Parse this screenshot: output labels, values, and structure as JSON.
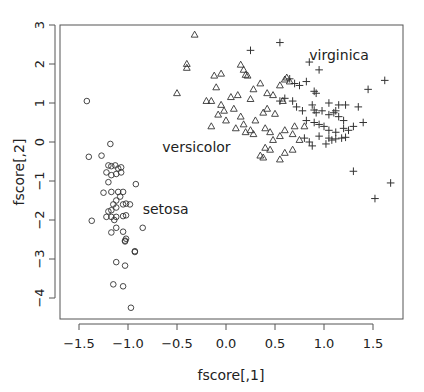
{
  "chart_data": {
    "type": "scatter",
    "title": "",
    "xlabel": "fscore[,1]",
    "ylabel": "fscore[,2]",
    "xlim": [
      -1.5,
      1.8
    ],
    "ylim": [
      -4.4,
      3.0
    ],
    "x_ticks": [
      -1.5,
      -1.0,
      -0.5,
      0.0,
      0.5,
      1.0,
      1.5
    ],
    "x_tick_labels": [
      "−1.5",
      "−1.0",
      "−0.5",
      "0.0",
      "0.5",
      "1.0",
      "1.5"
    ],
    "y_ticks": [
      -4,
      -3,
      -2,
      -1,
      0,
      1,
      2,
      3
    ],
    "y_tick_labels": [
      "−4",
      "−3",
      "−2",
      "−1",
      "0",
      "1",
      "2",
      "3"
    ],
    "grid": false,
    "legend": "none",
    "annotations": [
      {
        "text": "virginica",
        "x": 0.85,
        "y": 2.1
      },
      {
        "text": "versicolor",
        "x": -0.65,
        "y": -0.25
      },
      {
        "text": "setosa",
        "x": -0.85,
        "y": -1.85
      }
    ],
    "series": [
      {
        "name": "setosa",
        "marker": "circle",
        "points": [
          [
            -1.42,
            1.05
          ],
          [
            -1.18,
            -0.05
          ],
          [
            -1.4,
            -0.38
          ],
          [
            -1.27,
            -0.35
          ],
          [
            -1.2,
            -0.6
          ],
          [
            -1.17,
            -0.62
          ],
          [
            -1.13,
            -0.6
          ],
          [
            -1.1,
            -0.68
          ],
          [
            -1.07,
            -0.65
          ],
          [
            -1.22,
            -0.78
          ],
          [
            -1.17,
            -0.85
          ],
          [
            -1.12,
            -0.82
          ],
          [
            -1.07,
            -0.78
          ],
          [
            -1.2,
            -1.03
          ],
          [
            -0.92,
            -1.08
          ],
          [
            -1.25,
            -1.3
          ],
          [
            -1.17,
            -1.28
          ],
          [
            -1.1,
            -1.28
          ],
          [
            -1.05,
            -1.28
          ],
          [
            -1.12,
            -1.5
          ],
          [
            -1.08,
            -1.4
          ],
          [
            -1.15,
            -1.6
          ],
          [
            -1.05,
            -1.6
          ],
          [
            -0.98,
            -1.6
          ],
          [
            -1.17,
            -1.75
          ],
          [
            -1.12,
            -1.68
          ],
          [
            -1.02,
            -1.58
          ],
          [
            -1.37,
            -2.02
          ],
          [
            -1.22,
            -1.92
          ],
          [
            -1.17,
            -1.92
          ],
          [
            -1.12,
            -1.92
          ],
          [
            -1.2,
            -1.78
          ],
          [
            -1.14,
            -2.0
          ],
          [
            -1.05,
            -1.9
          ],
          [
            -1.02,
            -1.88
          ],
          [
            -0.85,
            -2.2
          ],
          [
            -1.17,
            -2.32
          ],
          [
            -1.12,
            -2.2
          ],
          [
            -1.05,
            -2.3
          ],
          [
            -1.02,
            -2.48
          ],
          [
            -1.03,
            -2.53
          ],
          [
            -1.03,
            -2.55
          ],
          [
            -0.93,
            -2.8
          ],
          [
            -0.93,
            -2.82
          ],
          [
            -1.12,
            -3.08
          ],
          [
            -1.03,
            -3.17
          ],
          [
            -1.15,
            -3.65
          ],
          [
            -1.05,
            -3.7
          ],
          [
            -0.97,
            -4.25
          ]
        ]
      },
      {
        "name": "versicolor",
        "marker": "triangle",
        "points": [
          [
            -0.32,
            2.75
          ],
          [
            -0.4,
            2.0
          ],
          [
            -0.4,
            1.9
          ],
          [
            -0.5,
            1.25
          ],
          [
            -0.12,
            1.7
          ],
          [
            -0.05,
            1.75
          ],
          [
            -0.1,
            1.4
          ],
          [
            -0.2,
            1.05
          ],
          [
            -0.15,
            1.05
          ],
          [
            -0.05,
            0.95
          ],
          [
            -0.02,
            0.8
          ],
          [
            -0.08,
            0.7
          ],
          [
            0.15,
            1.98
          ],
          [
            0.18,
            1.85
          ],
          [
            0.22,
            1.7
          ],
          [
            0.2,
            1.72
          ],
          [
            0.35,
            1.5
          ],
          [
            0.28,
            1.35
          ],
          [
            0.42,
            1.25
          ],
          [
            0.48,
            1.2
          ],
          [
            0.05,
            1.15
          ],
          [
            0.12,
            1.2
          ],
          [
            0.08,
            0.85
          ],
          [
            0.15,
            0.65
          ],
          [
            0.25,
            1.1
          ],
          [
            0.0,
            0.55
          ],
          [
            -0.15,
            0.4
          ],
          [
            0.1,
            0.35
          ],
          [
            0.18,
            0.45
          ],
          [
            0.3,
            0.55
          ],
          [
            0.38,
            0.75
          ],
          [
            0.42,
            0.85
          ],
          [
            0.5,
            0.72
          ],
          [
            0.58,
            1.05
          ],
          [
            0.55,
            1.45
          ],
          [
            0.6,
            1.6
          ],
          [
            0.62,
            1.65
          ],
          [
            0.65,
            1.55
          ],
          [
            0.2,
            0.25
          ],
          [
            0.25,
            0.3
          ],
          [
            0.28,
            0.2
          ],
          [
            0.4,
            0.35
          ],
          [
            0.45,
            0.25
          ],
          [
            0.48,
            0.05
          ],
          [
            0.55,
            0.15
          ],
          [
            0.6,
            0.3
          ],
          [
            0.68,
            0.2
          ],
          [
            0.7,
            0.4
          ],
          [
            0.75,
            0.05
          ],
          [
            0.8,
            0.4
          ],
          [
            0.35,
            -0.35
          ],
          [
            0.38,
            -0.4
          ],
          [
            0.45,
            -0.2
          ],
          [
            0.55,
            -0.45
          ],
          [
            0.6,
            -0.28
          ],
          [
            0.68,
            -0.2
          ],
          [
            0.4,
            -0.15
          ]
        ]
      },
      {
        "name": "virginica",
        "marker": "plus",
        "points": [
          [
            0.55,
            2.55
          ],
          [
            0.25,
            2.35
          ],
          [
            0.85,
            2.05
          ],
          [
            0.95,
            1.85
          ],
          [
            0.65,
            1.62
          ],
          [
            0.7,
            1.5
          ],
          [
            0.75,
            1.45
          ],
          [
            0.82,
            1.55
          ],
          [
            0.9,
            1.3
          ],
          [
            0.92,
            1.25
          ],
          [
            1.05,
            1.0
          ],
          [
            1.15,
            0.95
          ],
          [
            1.22,
            0.95
          ],
          [
            1.45,
            1.35
          ],
          [
            1.62,
            1.58
          ],
          [
            0.55,
            1.05
          ],
          [
            0.6,
            1.12
          ],
          [
            0.68,
            1.05
          ],
          [
            0.72,
            0.9
          ],
          [
            0.78,
            0.8
          ],
          [
            0.88,
            0.95
          ],
          [
            0.9,
            0.82
          ],
          [
            0.92,
            0.75
          ],
          [
            0.98,
            0.8
          ],
          [
            1.05,
            0.7
          ],
          [
            1.1,
            0.75
          ],
          [
            1.12,
            0.8
          ],
          [
            1.15,
            0.65
          ],
          [
            1.2,
            0.55
          ],
          [
            0.82,
            0.55
          ],
          [
            0.9,
            0.5
          ],
          [
            0.95,
            0.45
          ],
          [
            1.0,
            0.4
          ],
          [
            1.05,
            0.3
          ],
          [
            1.12,
            0.25
          ],
          [
            1.2,
            0.35
          ],
          [
            1.25,
            0.3
          ],
          [
            1.3,
            0.4
          ],
          [
            1.05,
            0.1
          ],
          [
            1.08,
            0.05
          ],
          [
            1.12,
            0.08
          ],
          [
            1.18,
            0.1
          ],
          [
            1.22,
            0.12
          ],
          [
            0.8,
            0.1
          ],
          [
            0.85,
            0.0
          ],
          [
            0.88,
            -0.1
          ],
          [
            0.95,
            0.15
          ],
          [
            1.02,
            -0.05
          ],
          [
            1.35,
            0.9
          ],
          [
            1.4,
            0.5
          ],
          [
            1.3,
            -0.75
          ],
          [
            1.52,
            -1.45
          ],
          [
            1.68,
            -1.05
          ]
        ]
      }
    ]
  }
}
